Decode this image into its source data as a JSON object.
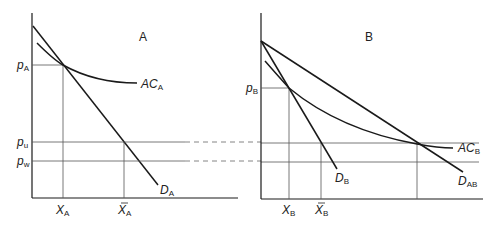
{
  "panels": {
    "A": {
      "title": "A",
      "price_label": "p",
      "price_sub": "A",
      "ac_label": "AC",
      "ac_sub": "A",
      "demand_label": "D",
      "demand_sub": "A",
      "x_label": "X",
      "x_sub": "A",
      "xbar_label": "X",
      "xbar_sub": "A"
    },
    "B": {
      "title": "B",
      "price_label": "p",
      "price_sub": "B",
      "ac_label": "AC",
      "ac_sub": "B",
      "demand_label": "D",
      "demand_sub": "B",
      "demand_ab_label": "D",
      "demand_ab_sub": "AB",
      "x_label": "X",
      "x_sub": "B",
      "xbar_label": "X",
      "xbar_sub": "B"
    }
  },
  "shared": {
    "pu_label": "p",
    "pu_sub": "u",
    "pw_label": "p",
    "pw_sub": "w"
  },
  "colors": {
    "line": "#1a1a1a",
    "guide": "#555555"
  }
}
